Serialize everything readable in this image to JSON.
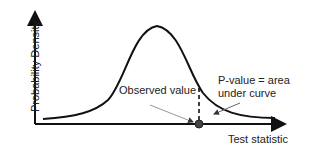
{
  "diagram": {
    "y_axis_label": "Probability Density",
    "x_axis_label": "Test statistic",
    "observed_label": "Observed value",
    "pvalue_label_line1": "P-value = area",
    "pvalue_label_line2": "under curve",
    "colors": {
      "line": "#111111",
      "pointer": "#888888",
      "point": "#333333"
    }
  }
}
